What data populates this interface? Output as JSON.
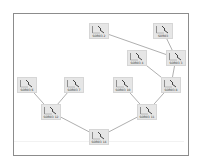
{
  "diagram": {
    "frame_color": "#8c8c8c",
    "edge_color": "#9a9a9a",
    "node_fill": "#e6e6e6",
    "node_icon": "network-device-icon",
    "nodes": [
      {
        "id": "n1",
        "label": "SOR03 2",
        "x": 89,
        "y": 23
      },
      {
        "id": "n2",
        "label": "SOR03",
        "x": 153,
        "y": 23
      },
      {
        "id": "n3",
        "label": "SOR03 4",
        "x": 127,
        "y": 50
      },
      {
        "id": "n4",
        "label": "SOR03 3",
        "x": 166,
        "y": 50
      },
      {
        "id": "n5",
        "label": "SOR03 6",
        "x": 17,
        "y": 77
      },
      {
        "id": "n6",
        "label": "SOR03 7",
        "x": 64,
        "y": 77
      },
      {
        "id": "n7",
        "label": "SOR03 10",
        "x": 113,
        "y": 77
      },
      {
        "id": "n8",
        "label": "SOR03 8",
        "x": 161,
        "y": 77
      },
      {
        "id": "n9",
        "label": "SOR03 12",
        "x": 41,
        "y": 104
      },
      {
        "id": "n10",
        "label": "SOR03 11",
        "x": 137,
        "y": 104
      },
      {
        "id": "n11",
        "label": "SOR03 14",
        "x": 89,
        "y": 129
      }
    ],
    "edges": [
      [
        "n1",
        "n4"
      ],
      [
        "n2",
        "n4"
      ],
      [
        "n3",
        "n8"
      ],
      [
        "n4",
        "n8"
      ],
      [
        "n5",
        "n9"
      ],
      [
        "n6",
        "n9"
      ],
      [
        "n7",
        "n10"
      ],
      [
        "n8",
        "n10"
      ],
      [
        "n9",
        "n11"
      ],
      [
        "n10",
        "n11"
      ]
    ]
  }
}
